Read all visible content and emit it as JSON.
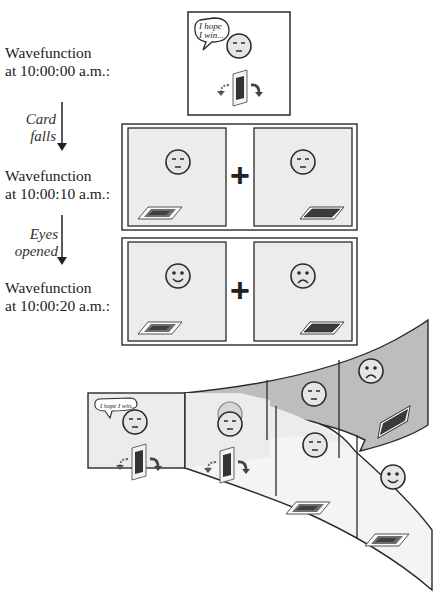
{
  "stages": [
    {
      "label_line1": "Wavefunction",
      "label_line2": "at 10:00:00 a.m.:"
    },
    {
      "label_line1": "Wavefunction",
      "label_line2": "at 10:00:10 a.m.:"
    },
    {
      "label_line1": "Wavefunction",
      "label_line2": "at 10:00:20 a.m.:"
    }
  ],
  "transitions": [
    {
      "line1": "Card",
      "line2": "falls"
    },
    {
      "line1": "Eyes",
      "line2": "opened"
    }
  ],
  "speech": {
    "top_line1": "I hope",
    "top_line2": "I win...",
    "sheet": "I hope I win..."
  },
  "operators": {
    "plus": "+"
  },
  "icons": {
    "neutral_face": "neutral-face-icon",
    "happy_face": "happy-face-icon",
    "sad_face": "sad-face-icon",
    "card_face_up": "card-face-up-icon",
    "card_face_down": "card-face-down-icon",
    "card_balanced": "card-balanced-icon",
    "fall_arrows": "curved-arrow-icon"
  },
  "colors": {
    "panel_fill": "#ececec",
    "sheet_upper": "#bdbdbd",
    "sheet_lower": "#f4f4f4",
    "stroke": "#2a2a2a"
  }
}
